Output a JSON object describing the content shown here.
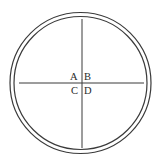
{
  "diagram": {
    "quadrant_labels": {
      "top_left": "A",
      "top_right": "B",
      "bottom_left": "C",
      "bottom_right": "D"
    },
    "colors": {
      "stroke": "#3a3a3a",
      "text": "#2a2a2a",
      "background": "#ffffff"
    }
  }
}
